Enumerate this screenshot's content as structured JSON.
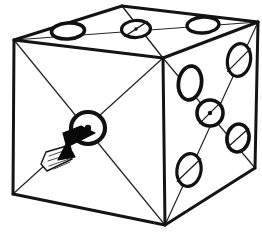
{
  "figure": {
    "background_color": "#ffffff",
    "ink_color": "#141414",
    "width": 262,
    "height": 232
  },
  "cube": {
    "vertices": {
      "top_back_left": [
        14,
        40
      ],
      "top_back_right": [
        258,
        22
      ],
      "top_apex_back": [
        122,
        6
      ],
      "top_front": [
        163,
        58
      ],
      "bottom_left": [
        13,
        194
      ],
      "bottom_front": [
        165,
        225
      ],
      "bottom_right": [
        255,
        168
      ]
    },
    "edges": [
      {
        "name": "top-left-to-apex",
        "from": [
          14,
          40
        ],
        "to": [
          122,
          6
        ],
        "width": 3.0
      },
      {
        "name": "apex-to-top-right",
        "from": [
          122,
          6
        ],
        "to": [
          258,
          22
        ],
        "width": 3.0
      },
      {
        "name": "top-left-to-front-apex",
        "from": [
          14,
          40
        ],
        "to": [
          163,
          58
        ],
        "width": 3.0
      },
      {
        "name": "front-apex-to-top-right",
        "from": [
          163,
          58
        ],
        "to": [
          258,
          22
        ],
        "width": 3.0
      },
      {
        "name": "left-vertical",
        "from": [
          14,
          40
        ],
        "to": [
          13,
          194
        ],
        "width": 3.0
      },
      {
        "name": "front-vertical",
        "from": [
          163,
          58
        ],
        "to": [
          165,
          225
        ],
        "width": 3.0
      },
      {
        "name": "right-vertical",
        "from": [
          258,
          22
        ],
        "to": [
          255,
          168
        ],
        "width": 3.0
      },
      {
        "name": "bottom-left-edge",
        "from": [
          13,
          194
        ],
        "to": [
          165,
          225
        ],
        "width": 3.0
      },
      {
        "name": "bottom-right-edge",
        "from": [
          165,
          225
        ],
        "to": [
          255,
          168
        ],
        "width": 3.0
      }
    ]
  },
  "faces": [
    {
      "name": "top-face",
      "pip_count": 3,
      "label": "Top face — three pips",
      "corners": [
        [
          14,
          40
        ],
        [
          122,
          6
        ],
        [
          258,
          22
        ],
        [
          163,
          58
        ]
      ],
      "diagonals": [
        {
          "from": [
            14,
            40
          ],
          "to": [
            258,
            22
          ],
          "width": 1.0,
          "style": "light"
        },
        {
          "from": [
            122,
            6
          ],
          "to": [
            163,
            58
          ],
          "width": 1.4,
          "style": "light"
        }
      ],
      "pips": [
        {
          "name": "top-pip-left",
          "cx": 68,
          "cy": 31,
          "rx": 16.5,
          "ry": 8.0,
          "rotate": -4,
          "ring": 3.6,
          "core": null,
          "slash": false
        },
        {
          "name": "top-pip-center",
          "cx": 136,
          "cy": 29,
          "rx": 14.5,
          "ry": 8.5,
          "rotate": -3,
          "ring": 3.2,
          "core": 1.7,
          "slash": true
        },
        {
          "name": "top-pip-right",
          "cx": 203,
          "cy": 25,
          "rx": 16.0,
          "ry": 8.0,
          "rotate": -4,
          "ring": 3.4,
          "core": null,
          "slash": false
        }
      ]
    },
    {
      "name": "right-face",
      "pip_count": 5,
      "label": "Right face — five pips",
      "corners": [
        [
          163,
          58
        ],
        [
          258,
          22
        ],
        [
          255,
          168
        ],
        [
          165,
          225
        ]
      ],
      "diagonals": [
        {
          "from": [
            163,
            58
          ],
          "to": [
            255,
            168
          ],
          "width": 1.2,
          "style": "light"
        },
        {
          "from": [
            258,
            22
          ],
          "to": [
            165,
            225
          ],
          "width": 1.2,
          "style": "light"
        }
      ],
      "pips": [
        {
          "name": "right-pip-top-left",
          "cx": 190,
          "cy": 83,
          "rx": 11.5,
          "ry": 17.0,
          "rotate": 8,
          "ring": 3.8,
          "core": null,
          "slash": false
        },
        {
          "name": "right-pip-top-right",
          "cx": 239,
          "cy": 60,
          "rx": 11.5,
          "ry": 16.5,
          "rotate": 10,
          "ring": 3.2,
          "core": null,
          "slash": true
        },
        {
          "name": "right-pip-center",
          "cx": 210,
          "cy": 113,
          "rx": 13.0,
          "ry": 13.0,
          "rotate": 0,
          "ring": 3.6,
          "core": 2.2,
          "slash": true
        },
        {
          "name": "right-pip-bottom-left",
          "cx": 189,
          "cy": 170,
          "rx": 12.0,
          "ry": 16.5,
          "rotate": 10,
          "ring": 3.2,
          "core": null,
          "slash": true
        },
        {
          "name": "right-pip-bottom-right",
          "cx": 238,
          "cy": 138,
          "rx": 11.0,
          "ry": 14.0,
          "rotate": 10,
          "ring": 3.6,
          "core": null,
          "slash": true
        }
      ]
    },
    {
      "name": "front-face",
      "pip_count": 1,
      "label": "Front face — one pip",
      "corners": [
        [
          14,
          40
        ],
        [
          163,
          58
        ],
        [
          165,
          225
        ],
        [
          13,
          194
        ]
      ],
      "diagonals": [
        {
          "from": [
            14,
            40
          ],
          "to": [
            165,
            225
          ],
          "width": 1.2,
          "style": "light"
        },
        {
          "from": [
            163,
            58
          ],
          "to": [
            13,
            194
          ],
          "width": 1.2,
          "style": "light"
        }
      ],
      "pips": [
        {
          "name": "front-pip-center",
          "cx": 88,
          "cy": 128,
          "rx": 17.0,
          "ry": 16.0,
          "rotate": 0,
          "ring": 4.2,
          "core": 3.2,
          "slash": false
        }
      ]
    }
  ],
  "annotation": {
    "name": "pointer-arrow",
    "label": "Arrow pointing to the single front-face pip",
    "tip": [
      95,
      135
    ],
    "tail_end": [
      41,
      164
    ],
    "head_fill": "#080808",
    "tail_fill": "#fbfbfb",
    "head_points": "95,133 69,146 75,157 58,160 66,144 63,133 81,126",
    "tail_points": "70,145 46,152 41,164 47,171 72,159",
    "hatch_lines": [
      {
        "from": [
          49,
          156
        ],
        "to": [
          72,
          148
        ]
      },
      {
        "from": [
          48,
          161
        ],
        "to": [
          73,
          153
        ]
      },
      {
        "from": [
          49,
          166
        ],
        "to": [
          72,
          158
        ]
      },
      {
        "from": [
          54,
          169
        ],
        "to": [
          70,
          162
        ]
      }
    ]
  }
}
